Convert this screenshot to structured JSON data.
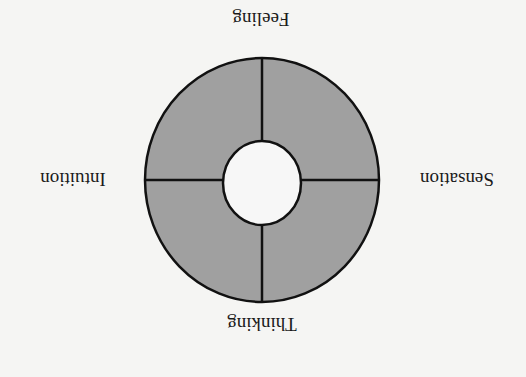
{
  "diagram": {
    "orientation": "rotated 180 degrees",
    "labels": {
      "top": "Feeling",
      "left": "Intuition",
      "right": "Sensation",
      "bottom": "Thinking"
    },
    "colors": {
      "background": "#f5f5f3",
      "ring_fill": "#a0a0a0",
      "inner_fill": "#f7f7f7",
      "stroke": "#111111",
      "text": "#1a1a1a"
    },
    "quadrants": 4
  }
}
